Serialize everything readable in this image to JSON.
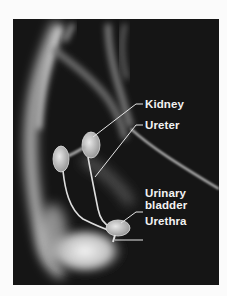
{
  "figure": {
    "colors": {
      "background": "#151515",
      "page": "#fbfbfb",
      "label_text": "#f2f2f2",
      "leader_line": "#e6e6e6"
    }
  },
  "labels": [
    {
      "id": "kidney",
      "text": "Kidney"
    },
    {
      "id": "ureter",
      "text": "Ureter"
    },
    {
      "id": "bladder_line1",
      "text": "Urinary"
    },
    {
      "id": "bladder_line2",
      "text": "bladder"
    },
    {
      "id": "urethra",
      "text": "Urethra"
    }
  ]
}
